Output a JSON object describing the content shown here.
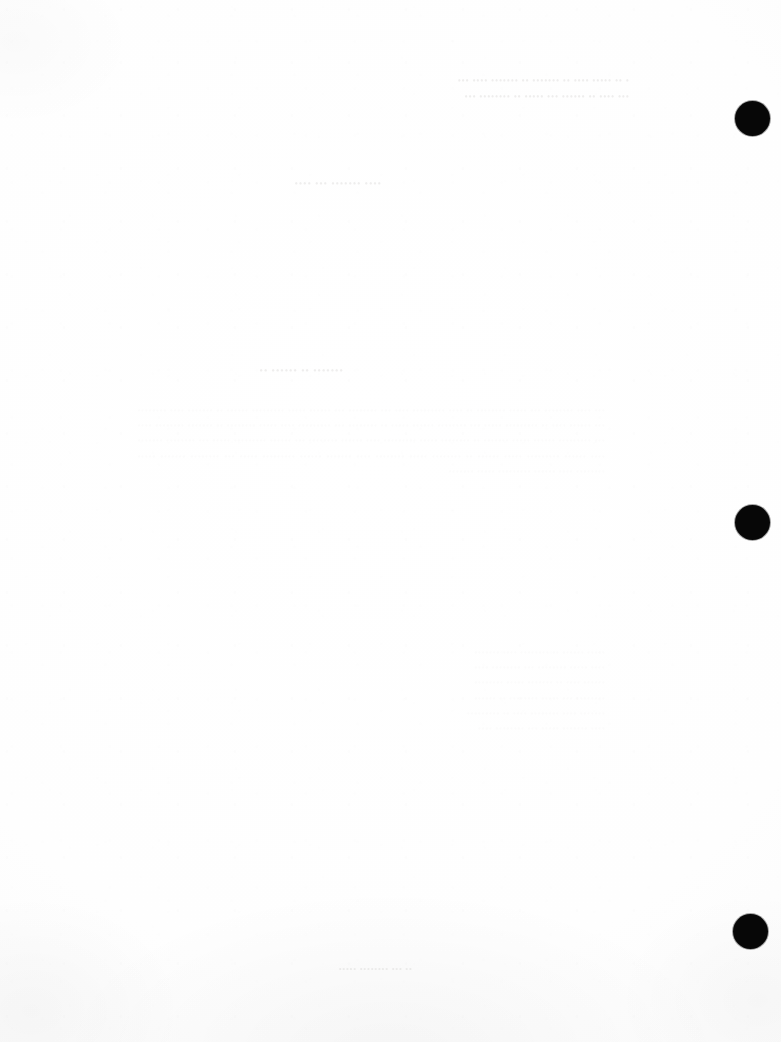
{
  "document": {
    "kind": "scanned-page",
    "page_background_color": "#fefefe",
    "ink_color": "#070707",
    "legibility_note": "Page is effectively blank; only faint mirrored show-through (bleed-through) text from the reverse side is visible and it is illegible.",
    "visible_text_transcription": ""
  },
  "ghost_text": {
    "header_note": "• •• ••••• •••• •• ••••••• •• ••••••• •••• •••\n••• •••• •• •••••• ••• ••••• •• •••••••• •••",
    "subheading": "•••• ••••••• ••• ••••",
    "title": "••••••• •• •••••• ••",
    "body": "••• •••• •••••••• ••• ••••• •••••••• •• •••• ••••••••• •••• ••• •••••••• ••• •••••• ••••• ••••••••• •••••• •• ••••••• •••• •••••••• ••• •••••• •••• •• ••••••••• ••••• ••• •••••••• •••••• ••••• •• •••••••• ••• ••••••••• •••• ••••• •••••••• •• ••••••• •••••••• •••• ••• ••••••••• •••••• ••••• ••••••• •• •••••••• ••••• ••••••••• •••• •••••• •••••••• ••• •••••• ••••••••• ••••• ••• •••••••• ••••••• •••• •••••• ••••••••• ••••• •••••• •• •••••••• ••••• •••••••• •••• ••••••• •••••• ••••••••• ••••• ••• •••••••• ••••••• ••••• •••••••• •••• •••••• ••••••••• ••••• •••••••",
    "list_block": "••••• •••••• •• •••••••• •••• •••••••\n•••• ••••• •••••••• ••• •••••••• ••••\n•••••• •••• •• ••••••• ••••• ••••••••\n•••••••• ••• ••••• •••••••• •• ••••••\n••••••• •••• •••••••• •••• •• •••••••••\n•••• ••••••• ••••• ••• •••••••• ••••",
    "footer": "•• ••• •••••••• •••••"
  },
  "punch_holes": {
    "icon": "hole-punch-mark",
    "color": "#070707",
    "count": 3,
    "marks": [
      {
        "label": "top",
        "cx": 753,
        "cy": 119,
        "d": 35
      },
      {
        "label": "middle",
        "cx": 753,
        "cy": 523,
        "d": 35
      },
      {
        "label": "bottom",
        "cx": 751,
        "cy": 932,
        "d": 35
      }
    ]
  }
}
